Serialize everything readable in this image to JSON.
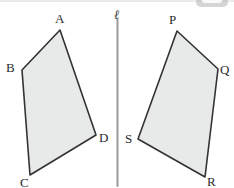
{
  "figure": {
    "width": 234,
    "height": 188,
    "background_color": "#ffffff",
    "stroke_color": "#333333",
    "fill_color": "#e8e9e9",
    "label_color": "#2b2b2b",
    "mirror_line": {
      "label": "ℓ",
      "label_x": 114,
      "label_y": 8,
      "x": 117.5,
      "y1": 19,
      "y2": 186,
      "color": "#9a9a9a",
      "width": 2
    },
    "shapes": [
      {
        "name": "quadrilateral-abcd",
        "points": "60,30 22,70 30,175 96,135",
        "vertices": [
          {
            "label": "A",
            "x": 60,
            "y": 30,
            "label_x": 55,
            "label_y": 12
          },
          {
            "label": "B",
            "x": 22,
            "y": 70,
            "label_x": 6,
            "label_y": 61
          },
          {
            "label": "C",
            "x": 30,
            "y": 175,
            "label_x": 20,
            "label_y": 176
          },
          {
            "label": "D",
            "x": 96,
            "y": 135,
            "label_x": 99,
            "label_y": 131
          }
        ]
      },
      {
        "name": "quadrilateral-pqrs",
        "points": "177,31 218,69 205,177 138,139",
        "vertices": [
          {
            "label": "P",
            "x": 177,
            "y": 31,
            "label_x": 169,
            "label_y": 13
          },
          {
            "label": "Q",
            "x": 218,
            "y": 69,
            "label_x": 220,
            "label_y": 63
          },
          {
            "label": "R",
            "x": 205,
            "y": 177,
            "label_x": 207,
            "label_y": 175
          },
          {
            "label": "S",
            "x": 138,
            "y": 139,
            "label_x": 125,
            "label_y": 132
          }
        ]
      }
    ]
  }
}
